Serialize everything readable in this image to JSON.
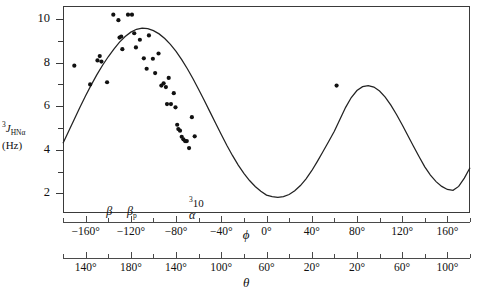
{
  "axes": {
    "y": {
      "title_line1_pre": "3",
      "title_line1_main": "J",
      "title_line1_sub": "HNα",
      "title_line2": "(Hz)",
      "ticks": [
        2,
        4,
        6,
        8,
        10
      ],
      "minor_ticks": [
        3,
        5,
        7,
        9
      ],
      "labels": [
        "2",
        "4",
        "6",
        "8",
        "10"
      ],
      "range": [
        1.1,
        10.6
      ]
    },
    "phi": {
      "name": "ϕ",
      "labels": [
        "−160°",
        "−120°",
        "−80°",
        "−40°",
        "0°",
        "40°",
        "80°",
        "120°",
        "160°"
      ],
      "values": [
        -160,
        -120,
        -80,
        -40,
        0,
        40,
        80,
        120,
        160
      ],
      "minor_values": [
        -180,
        -140,
        -100,
        -60,
        -20,
        20,
        60,
        100,
        140,
        180
      ],
      "range": [
        -180,
        180
      ]
    },
    "theta": {
      "name": "θ",
      "labels": [
        "140°",
        "180°",
        "140°",
        "100°",
        "60°",
        "20°",
        "20°",
        "60°",
        "100°"
      ],
      "at_phi": [
        -160,
        -120,
        -80,
        -40,
        0,
        40,
        80,
        120,
        160
      ]
    },
    "regions": [
      {
        "label": "β",
        "phi": -139,
        "sup": "",
        "has_sup": false
      },
      {
        "label": "β",
        "phi": -119,
        "sup": "p",
        "has_sup": true
      },
      {
        "label": "α",
        "phi": -62,
        "sup": "310",
        "has_sup": false,
        "above": "310"
      }
    ]
  },
  "chart_data": {
    "type": "scatter",
    "title": "",
    "xlabel": "ϕ",
    "ylabel": "3J_HNα (Hz)",
    "xlim": [
      -180,
      180
    ],
    "ylim": [
      1.1,
      10.6
    ],
    "grid": false,
    "legend": "none",
    "annotations": [
      "β",
      "βp",
      "α",
      "310"
    ],
    "series": [
      {
        "name": "Karplus curve",
        "type": "line",
        "x": [
          -180,
          -175,
          -170,
          -165,
          -160,
          -155,
          -150,
          -145,
          -140,
          -135,
          -130,
          -125,
          -120,
          -115,
          -110,
          -105,
          -100,
          -95,
          -90,
          -85,
          -80,
          -75,
          -70,
          -65,
          -60,
          -55,
          -50,
          -45,
          -40,
          -35,
          -30,
          -25,
          -20,
          -15,
          -10,
          -5,
          0,
          5,
          10,
          15,
          20,
          25,
          30,
          35,
          40,
          45,
          50,
          55,
          60,
          65,
          70,
          75,
          80,
          85,
          90,
          95,
          100,
          105,
          110,
          115,
          120,
          125,
          130,
          135,
          140,
          145,
          150,
          155,
          160,
          165,
          170,
          175,
          180
        ],
        "y": [
          4.3,
          4.85,
          5.4,
          5.95,
          6.48,
          6.98,
          7.45,
          7.88,
          8.27,
          8.62,
          8.94,
          9.2,
          9.4,
          9.53,
          9.58,
          9.56,
          9.47,
          9.32,
          9.11,
          8.84,
          8.52,
          8.14,
          7.72,
          7.26,
          6.77,
          6.26,
          5.74,
          5.22,
          4.7,
          4.2,
          3.73,
          3.3,
          2.92,
          2.59,
          2.32,
          2.1,
          1.92,
          1.85,
          1.82,
          1.85,
          1.95,
          2.12,
          2.36,
          2.67,
          3.04,
          3.47,
          3.92,
          4.38,
          4.85,
          5.4,
          5.95,
          6.4,
          6.72,
          6.9,
          6.95,
          6.88,
          6.7,
          6.42,
          6.05,
          5.62,
          5.15,
          4.66,
          4.16,
          3.68,
          3.22,
          2.84,
          2.54,
          2.32,
          2.18,
          2.14,
          2.32,
          2.7,
          3.18
        ]
      },
      {
        "name": "Observed couplings",
        "type": "scatter",
        "points": [
          [
            -170.0,
            7.86
          ],
          [
            -156.0,
            7.0
          ],
          [
            -149.5,
            8.1
          ],
          [
            -147.5,
            8.3
          ],
          [
            -146.0,
            8.05
          ],
          [
            -141.0,
            7.1
          ],
          [
            -135.5,
            10.2
          ],
          [
            -131.0,
            9.95
          ],
          [
            -130.0,
            9.15
          ],
          [
            -128.5,
            9.2
          ],
          [
            -127.5,
            8.62
          ],
          [
            -122.5,
            10.2
          ],
          [
            -119.0,
            10.2
          ],
          [
            -117.0,
            9.35
          ],
          [
            -115.5,
            8.7
          ],
          [
            -112.0,
            9.05
          ],
          [
            -108.5,
            8.2
          ],
          [
            -106.0,
            7.72
          ],
          [
            -104.0,
            9.25
          ],
          [
            -100.5,
            8.18
          ],
          [
            -98.5,
            7.52
          ],
          [
            -95.5,
            8.42
          ],
          [
            -93.0,
            6.95
          ],
          [
            -91.0,
            7.05
          ],
          [
            -89.0,
            6.88
          ],
          [
            -88.0,
            6.1
          ],
          [
            -86.5,
            7.3
          ],
          [
            -84.5,
            6.1
          ],
          [
            -82.0,
            6.6
          ],
          [
            -80.5,
            5.95
          ],
          [
            -79.0,
            5.15
          ],
          [
            -78.0,
            4.95
          ],
          [
            -76.5,
            4.88
          ],
          [
            -75.0,
            4.6
          ],
          [
            -73.5,
            4.48
          ],
          [
            -72.0,
            4.4
          ],
          [
            -70.5,
            4.4
          ],
          [
            -68.5,
            4.08
          ],
          [
            -66.0,
            5.5
          ],
          [
            -63.5,
            4.62
          ],
          [
            62.0,
            6.95
          ]
        ]
      }
    ]
  }
}
